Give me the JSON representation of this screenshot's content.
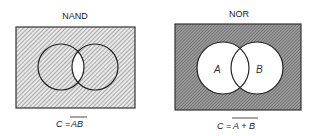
{
  "diagrams": [
    {
      "id": "nand",
      "title": "NAND",
      "formula_lhs": "C =",
      "formula_rhs": "AB",
      "formula_overbar": true,
      "shaded_region": "everything except A∩B",
      "hatch": "light diagonal",
      "circle_labels": []
    },
    {
      "id": "nor",
      "title": "NOR",
      "formula_lhs": "C =",
      "formula_rhs": "A + B",
      "formula_overbar": true,
      "shaded_region": "outside A∪B",
      "hatch": "dense diagonal",
      "circle_labels": [
        "A",
        "B"
      ]
    }
  ]
}
